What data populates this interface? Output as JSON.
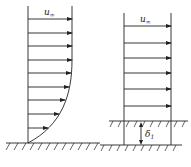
{
  "diagram": {
    "left_panel": {
      "label": "u",
      "label_sub": "∞",
      "description": "boundary layer velocity profile over a flat wall",
      "arrow_count": 9
    },
    "right_panel": {
      "label": "u",
      "label_sub": "∞",
      "thickness_label": "δ",
      "thickness_sub": "1",
      "description": "uniform profile with wall displaced by displacement thickness",
      "arrow_count": 6
    }
  }
}
